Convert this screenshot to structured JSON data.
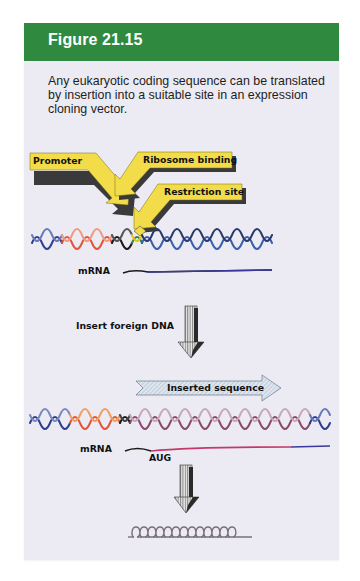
{
  "figure": {
    "title": "Figure 21.15",
    "caption": "Any eukaryotic coding sequence can be translated by insertion into a suitable site in an expression cloning vector.",
    "colors": {
      "header": "#2f8a3f",
      "panel_background": "#ecebf3",
      "callout_fill": "#f2dc4a",
      "callout_shadow": "#3a3a3a",
      "vector_dna": "#2f3f8f",
      "promoter_dna": "#e2553a",
      "insert_dna": "#8a5a78",
      "mrna_insert": "#c23a6a",
      "protein": "#7a6f7a"
    }
  },
  "diagram": {
    "callouts": [
      {
        "label": "Promoter"
      },
      {
        "label": "Ribosome binding"
      },
      {
        "label": "Restriction site"
      }
    ],
    "top_mrna_label": "mRNA",
    "step_label": "Insert foreign DNA",
    "insert_arrow_label": "Inserted sequence",
    "bottom_mrna_label": "mRNA",
    "start_codon_label": "AUG",
    "protein_glyph": "QQQQQQQQQQQQ"
  }
}
